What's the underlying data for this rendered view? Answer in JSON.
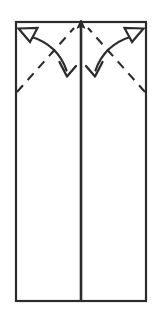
{
  "diagram": {
    "title": "Fold step diagram",
    "type": "instructional-fold-diagram",
    "canvas": {
      "width": 158,
      "height": 321,
      "background": "#ffffff"
    },
    "colors": {
      "stroke": "#2b2b2b",
      "solid_line": "#2b2b2b",
      "dashed_line": "#2b2b2b",
      "arrow": "#2b2b2b",
      "fill": "#ffffff"
    },
    "shapes": {
      "outer_rectangle": {
        "name": "outer-rectangle",
        "x": 16,
        "y": 22,
        "width": 130,
        "height": 279,
        "stroke_width": 2.2,
        "fill": "none"
      },
      "center_divider": {
        "name": "center-vertical-line",
        "x": 81,
        "y_top": 22,
        "y_bottom": 301,
        "stroke_width": 2.6,
        "has_top_arrowhead": true
      }
    },
    "fold_lines": [
      {
        "name": "dashed-fold-line-left",
        "from": {
          "x": 17,
          "y": 92
        },
        "to": {
          "x": 74,
          "y": 28
        },
        "style": "dashed",
        "dash_pattern": "9 7",
        "stroke_width": 2.1
      },
      {
        "name": "dashed-fold-line-right",
        "from": {
          "x": 145,
          "y": 92
        },
        "to": {
          "x": 88,
          "y": 28
        },
        "style": "dashed",
        "dash_pattern": "9 7",
        "stroke_width": 2.1
      }
    ],
    "motion_arrows": [
      {
        "name": "fold-arrow-left",
        "description": "Curved double-headed arrow crossing left dashed fold line",
        "start": {
          "x": 28,
          "y": 34
        },
        "control": {
          "x": 56,
          "y": 44
        },
        "end": {
          "x": 67,
          "y": 74
        },
        "start_head": "hollow-triangle",
        "end_head": "open-v",
        "stroke_width": 2.2
      },
      {
        "name": "fold-arrow-right",
        "description": "Curved double-headed arrow crossing right dashed fold line",
        "start": {
          "x": 134,
          "y": 34
        },
        "control": {
          "x": 106,
          "y": 44
        },
        "end": {
          "x": 95,
          "y": 74
        },
        "start_head": "hollow-triangle",
        "end_head": "open-v",
        "stroke_width": 2.2
      }
    ],
    "arrowheads": {
      "hollow_triangle_left": {
        "name": "arrowhead-hollow-left",
        "direction": "up-left"
      },
      "hollow_triangle_right": {
        "name": "arrowhead-hollow-right",
        "direction": "up-right"
      },
      "open_v_left": {
        "name": "arrowhead-open-v-left",
        "direction": "down"
      },
      "open_v_right": {
        "name": "arrowhead-open-v-right",
        "direction": "down"
      },
      "center_top": {
        "name": "arrowhead-center-top",
        "direction": "up"
      }
    }
  }
}
